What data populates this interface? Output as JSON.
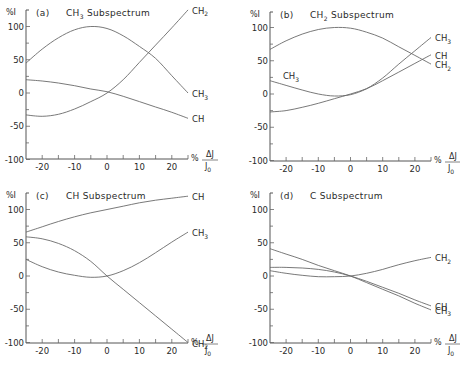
{
  "figure": {
    "y_axis_label": "%I",
    "x_axis_label_prefix": "%",
    "x_axis_label_num": "ΔJ",
    "x_axis_label_den": "J",
    "x_axis_label_den_sub": "0"
  },
  "chart_data": [
    {
      "type": "line",
      "panel": "(a)",
      "title": "CH3 Subspectrum",
      "title_main": "CH",
      "title_sub": "3",
      "title_rest": "Subspectrum",
      "xlabel": "% ΔJ/J0",
      "ylabel": "% I",
      "xlim": [
        -25,
        25
      ],
      "ylim": [
        -100,
        125
      ],
      "xticks": [
        -20,
        -10,
        0,
        10,
        20
      ],
      "yticks": [
        -100,
        -50,
        0,
        50,
        100
      ],
      "grid": false,
      "x": [
        -25,
        -20,
        -15,
        -10,
        -5,
        0,
        5,
        10,
        15,
        20,
        25
      ],
      "series": [
        {
          "name": "CH2",
          "label_main": "CH",
          "label_sub": "2",
          "values": [
            -33,
            -35,
            -32,
            -24,
            -13,
            0,
            20,
            46,
            72,
            98,
            125
          ]
        },
        {
          "name": "CH3",
          "label_main": "CH",
          "label_sub": "3",
          "values": [
            45,
            66,
            83,
            95,
            100,
            97,
            86,
            70,
            52,
            26,
            0
          ]
        },
        {
          "name": "CH",
          "label_main": "CH",
          "label_sub": "",
          "values": [
            20,
            18,
            15,
            11,
            6,
            2,
            -5,
            -13,
            -21,
            -29,
            -38
          ]
        }
      ]
    },
    {
      "type": "line",
      "panel": "(b)",
      "title": "CH2 Subspectrum",
      "title_main": "CH",
      "title_sub": "2",
      "title_rest": "Subspectrum",
      "xlabel": "% ΔJ/J0",
      "ylabel": "% I",
      "xlim": [
        -25,
        25
      ],
      "ylim": [
        -100,
        100
      ],
      "xticks": [
        -20,
        -10,
        0,
        10,
        20
      ],
      "yticks": [
        -100,
        -50,
        0,
        50,
        100
      ],
      "grid": false,
      "x": [
        -25,
        -20,
        -15,
        -10,
        -5,
        0,
        5,
        10,
        15,
        20,
        25
      ],
      "series": [
        {
          "name": "CH3",
          "label_main": "CH",
          "label_sub": "3",
          "values": [
            20,
            13,
            6,
            0,
            -3,
            -1,
            8,
            24,
            45,
            65,
            85
          ]
        },
        {
          "name": "CH",
          "label_main": "CH",
          "label_sub": "",
          "values": [
            -27,
            -25,
            -20,
            -14,
            -7,
            0,
            8,
            20,
            33,
            46,
            59
          ]
        },
        {
          "name": "CH2",
          "label_main": "CH",
          "label_sub": "2",
          "values": [
            67,
            80,
            90,
            97,
            100,
            99,
            93,
            84,
            71,
            58,
            45
          ]
        }
      ],
      "annotations": [
        {
          "text": "CH3",
          "x": -21,
          "y": 22
        }
      ]
    },
    {
      "type": "line",
      "panel": "(c)",
      "title": "CH Subspectrum",
      "title_main": "CH",
      "title_sub": "",
      "title_rest": "Subspectrum",
      "xlabel": "% ΔJ/J0",
      "ylabel": "% I",
      "xlim": [
        -25,
        25
      ],
      "ylim": [
        -100,
        125
      ],
      "xticks": [
        -20,
        -10,
        0,
        10,
        20
      ],
      "yticks": [
        -100,
        -50,
        0,
        50,
        100
      ],
      "grid": false,
      "x": [
        -25,
        -20,
        -15,
        -10,
        -5,
        0,
        5,
        10,
        15,
        20,
        25
      ],
      "series": [
        {
          "name": "CH",
          "label_main": "CH",
          "label_sub": "",
          "values": [
            66,
            74,
            82,
            89,
            95,
            100,
            105,
            110,
            114,
            117,
            120
          ]
        },
        {
          "name": "CH3",
          "label_main": "CH",
          "label_sub": "3",
          "values": [
            25,
            14,
            6,
            1,
            -2,
            0,
            8,
            20,
            35,
            51,
            66
          ]
        },
        {
          "name": "CH2",
          "label_main": "CH",
          "label_sub": "2",
          "values": [
            59,
            56,
            49,
            38,
            22,
            0,
            -20,
            -40,
            -60,
            -80,
            -100
          ]
        }
      ]
    },
    {
      "type": "line",
      "panel": "(d)",
      "title": "C Subspectrum",
      "title_main": "C",
      "title_sub": "",
      "title_rest": "Subspectrum",
      "xlabel": "% ΔJ/J0",
      "ylabel": "% I",
      "xlim": [
        -25,
        25
      ],
      "ylim": [
        -100,
        100
      ],
      "xticks": [
        -20,
        -10,
        0,
        10,
        20
      ],
      "yticks": [
        -100,
        -50,
        0,
        50,
        100
      ],
      "grid": false,
      "x": [
        -25,
        -20,
        -15,
        -10,
        -5,
        0,
        5,
        10,
        15,
        20,
        25
      ],
      "series": [
        {
          "name": "CH2",
          "label_main": "CH",
          "label_sub": "2",
          "values": [
            8,
            4,
            1,
            -1,
            -1,
            0,
            4,
            10,
            17,
            23,
            28
          ]
        },
        {
          "name": "CH",
          "label_main": "CH",
          "label_sub": "",
          "values": [
            13,
            13,
            12,
            10,
            6,
            0,
            -8,
            -17,
            -26,
            -36,
            -45
          ]
        },
        {
          "name": "CH3",
          "label_main": "CH",
          "label_sub": "3",
          "values": [
            41,
            33,
            25,
            16,
            8,
            0,
            -10,
            -20,
            -30,
            -41,
            -51
          ]
        }
      ]
    }
  ],
  "panels_layout": [
    {
      "ox": 26,
      "oy": 93,
      "x0": 26,
      "x1": 188,
      "yTop": 10,
      "yBottom": 159,
      "pxPerUnitY": 0.665
    },
    {
      "ox": 270,
      "oy": 94,
      "x0": 270,
      "x1": 431,
      "yTop": 12,
      "yBottom": 161,
      "pxPerUnitY": 0.665
    },
    {
      "ox": 26,
      "oy": 276,
      "x0": 26,
      "x1": 188,
      "yTop": 193,
      "yBottom": 343,
      "pxPerUnitY": 0.665
    },
    {
      "ox": 270,
      "oy": 276,
      "x0": 270,
      "x1": 431,
      "yTop": 193,
      "yBottom": 343,
      "pxPerUnitY": 0.665
    }
  ]
}
